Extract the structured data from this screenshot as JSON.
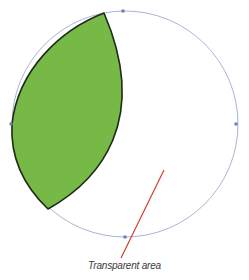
{
  "figure": {
    "caption_cut": "",
    "annotation_label": "Transparent area",
    "colors": {
      "fill": "#76b947",
      "shape_stroke": "#1f2a17",
      "circle_path": "#a9b4d6",
      "anchor": "#6b7bb0",
      "leader_line": "#d0402e",
      "label_text": "#3a3a3a"
    },
    "circle": {
      "cx": 125,
      "cy": 124,
      "r": 113
    },
    "green_shape": {
      "top_point": [
        104,
        13
      ],
      "bottom_point": [
        48,
        209
      ],
      "left_extent": 12,
      "right_bulge": 141
    },
    "anchors": [
      [
        123,
        11
      ],
      [
        236,
        124
      ],
      [
        11,
        124
      ],
      [
        125,
        237
      ]
    ],
    "leader_line": {
      "from": [
        164,
        170
      ],
      "to": [
        121,
        258
      ]
    }
  }
}
